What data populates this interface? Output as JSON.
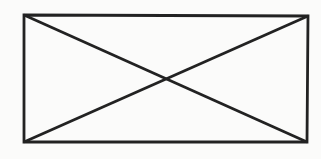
{
  "figure": {
    "outline_points": "24,15 308,16 307,142 24,142",
    "diagonal_tl_br": "24,15 307,142",
    "diagonal_bl_tr": "24,142 308,16",
    "stroke_color": "#222222",
    "stroke_width": "2.8",
    "background_color": "#fbfbfa"
  }
}
